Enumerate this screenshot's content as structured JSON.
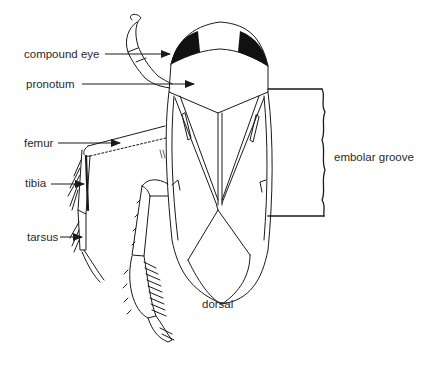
{
  "diagram": {
    "view_label": "dorsal",
    "labels": {
      "compound_eye": "compound eye",
      "pronotum": "pronotum",
      "femur": "femur",
      "tibia": "tibia",
      "tarsus": "tarsus",
      "embolar_groove": "embolar groove"
    },
    "colors": {
      "ink": "#1a1a1a",
      "text": "#2a2a2a",
      "background": "#ffffff"
    }
  }
}
